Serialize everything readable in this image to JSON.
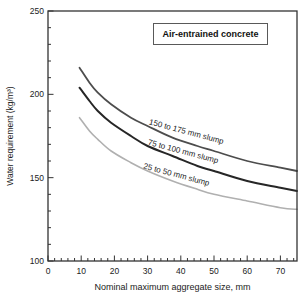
{
  "figure": {
    "background": "#ffffff",
    "axis_color": "#333333",
    "tick_label_color": "#222222"
  },
  "chart_data": {
    "type": "line",
    "title": "Air-entrained concrete",
    "xlabel": "Nominal maximum aggregate size, mm",
    "ylabel": "Water requirement (kg/m³)",
    "xlim": [
      0,
      75
    ],
    "ylim": [
      100,
      250
    ],
    "x_major_ticks": [
      0,
      10,
      20,
      30,
      40,
      50,
      60,
      70
    ],
    "x_minor_step": 2,
    "y_major_ticks": [
      100,
      150,
      200,
      250
    ],
    "y_minor_step": 10,
    "grid": false,
    "legend_position": "boxed-annotation-top-center",
    "x": [
      9.5,
      12.5,
      15,
      19,
      25,
      30,
      37.5,
      45,
      50,
      60,
      70,
      75
    ],
    "series": [
      {
        "name": "150 to 175 mm slump",
        "color": "#4d4d4d",
        "stroke_width": 1.8,
        "values": [
          216,
          207,
          201,
          194,
          186,
          181,
          174,
          169,
          166,
          160,
          156,
          154
        ],
        "label": {
          "text": "150 to 175 mm slump",
          "at_mm": 41.5,
          "dy": -8,
          "angle": 15
        }
      },
      {
        "name": "75 to 100 mm slump",
        "color": "#262626",
        "stroke_width": 2,
        "values": [
          204,
          196,
          190,
          183,
          175,
          169,
          163,
          157,
          154,
          148,
          144,
          142
        ],
        "label": {
          "text": "75 to 100 mm slump",
          "at_mm": 40.5,
          "dy": -6,
          "angle": 15
        }
      },
      {
        "name": "25 to 50 mm slump",
        "color": "#b0b0b0",
        "stroke_width": 1.6,
        "values": [
          186,
          178,
          173,
          166,
          159,
          154,
          148,
          143,
          140,
          136,
          132,
          131
        ],
        "label": {
          "text": "25 to 50 mm slump",
          "at_mm": 38.5,
          "dy": -5,
          "angle": 15
        }
      }
    ]
  }
}
